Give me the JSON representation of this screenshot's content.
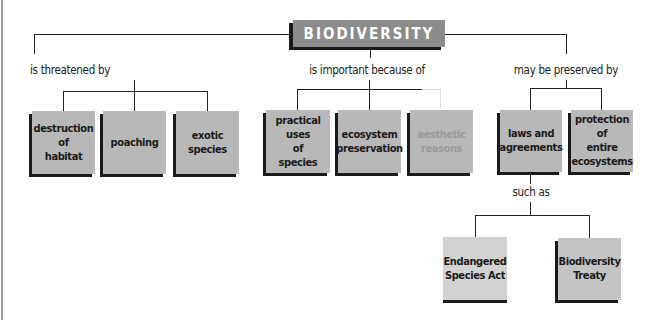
{
  "diagram": {
    "type": "concept-map",
    "root": {
      "label": "BIODIVERSITY"
    },
    "branches": [
      {
        "link": "is threatened by",
        "nodes": [
          "destruction of habitat",
          "poaching",
          "exotic species"
        ]
      },
      {
        "link": "is important because of",
        "nodes": [
          "practical uses of species",
          "ecosystem preservation",
          "aesthetic reasons"
        ]
      },
      {
        "link": "may be preserved by",
        "nodes": [
          "laws and agreements",
          "protection of entire ecosystems"
        ]
      }
    ],
    "sub_branch": {
      "parent": "laws and agreements",
      "link": "such as",
      "nodes": [
        "Endangered Species Act",
        "Biodiversity Treaty"
      ]
    }
  },
  "labels": {
    "root": "BIODIVERSITY",
    "link_threatened": "is threatened by",
    "link_important": "is important because of",
    "link_preserved": "may be preserved by",
    "link_such_as": "such as"
  },
  "nodes": {
    "destruction": [
      "destruction",
      "of",
      "habitat"
    ],
    "poaching": [
      "poaching"
    ],
    "exotic": [
      "exotic",
      "species"
    ],
    "practical": [
      "practical uses",
      "of species"
    ],
    "ecosystem": [
      "ecosystem",
      "preservation"
    ],
    "aesthetic": [
      "aesthetic",
      "reasons"
    ],
    "laws": [
      "laws and",
      "agreements"
    ],
    "protection": [
      "protection of",
      "entire",
      "ecosystems"
    ],
    "endangered": [
      "Endangered",
      "Species Act"
    ],
    "treaty": [
      "Biodiversity",
      "Treaty"
    ]
  },
  "colors": {
    "box_fill": "#b8b8b8",
    "root_fill": "#8c8c8c",
    "shadow": "#1a1a1a",
    "light_box_fill": "#d2d2d2"
  }
}
